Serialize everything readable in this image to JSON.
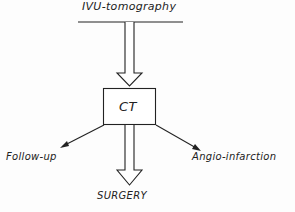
{
  "diagram": {
    "top_label": "IVU-tomography",
    "center_box": "CT",
    "left_label": "Follow-up",
    "right_label": "Angio-infarction",
    "bottom_label": "SURGERY"
  }
}
